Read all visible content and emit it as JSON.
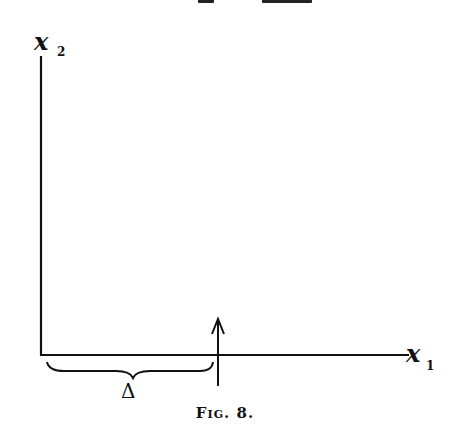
{
  "figure": {
    "caption": "Fig. 8.",
    "axes": {
      "vertical_label": "x",
      "vertical_subscript": "2",
      "horizontal_label": "x",
      "horizontal_subscript": "1"
    },
    "brace_label": "Δ",
    "marker": "upward arrow crossing the x1 axis at distance Δ from origin",
    "colors": {
      "ink": "#111111",
      "background": "#ffffff"
    }
  }
}
